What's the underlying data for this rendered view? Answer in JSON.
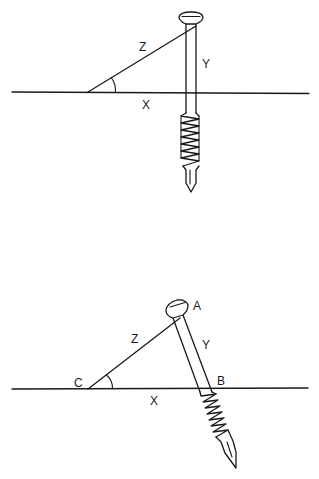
{
  "figure": {
    "panels": [
      {
        "id": "top",
        "description": "Screw inserted perpendicular to surface line",
        "labels": {
          "z": "Z",
          "y": "Y",
          "x": "X"
        }
      },
      {
        "id": "bottom",
        "description": "Screw inserted at an angle to surface line",
        "labels": {
          "a": "A",
          "b": "B",
          "c": "C",
          "z": "Z",
          "y": "Y",
          "x": "X"
        }
      }
    ],
    "colors": {
      "line": "#1a1a1a",
      "background": "#ffffff"
    }
  }
}
